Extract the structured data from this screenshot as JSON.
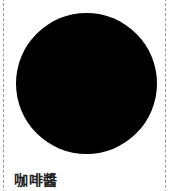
{
  "item": {
    "label": "咖啡醬",
    "swatch_color": "#000000"
  }
}
